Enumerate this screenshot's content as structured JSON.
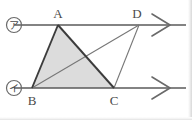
{
  "figure": {
    "background_color": "#ffffff",
    "shaded_fill_color": "#dcdcdc",
    "line_color": "#5a5a5a",
    "dark_line_color": "#3c3c3c",
    "label_color": "#4a4a4a",
    "parallel_lines": [
      {
        "id": "line-upper",
        "marker_label": "ア",
        "marker_name": "circled-a-marker",
        "y": 25,
        "x_start": 14,
        "x_end": 186,
        "arrow_label": ">"
      },
      {
        "id": "line-lower",
        "marker_label": "イ",
        "marker_name": "circled-i-marker",
        "y": 88,
        "x_start": 14,
        "x_end": 186,
        "arrow_label": ">"
      }
    ],
    "points": [
      {
        "id": "A",
        "label": "A",
        "x": 58,
        "y": 25,
        "label_x": 58,
        "label_y": 16,
        "on_line": "line-upper"
      },
      {
        "id": "D",
        "label": "D",
        "x": 139,
        "y": 25,
        "label_x": 137,
        "label_y": 16,
        "on_line": "line-upper"
      },
      {
        "id": "B",
        "label": "B",
        "x": 32,
        "y": 88,
        "label_x": 32,
        "label_y": 104,
        "on_line": "line-lower"
      },
      {
        "id": "C",
        "label": "C",
        "x": 114,
        "y": 88,
        "label_x": 114,
        "label_y": 104,
        "on_line": "line-lower"
      }
    ],
    "segments": [
      {
        "id": "AB",
        "from": "A",
        "to": "B",
        "weight": "heavy"
      },
      {
        "id": "AC",
        "from": "A",
        "to": "C",
        "weight": "heavy"
      },
      {
        "id": "BD",
        "from": "B",
        "to": "D",
        "weight": "light"
      },
      {
        "id": "CD",
        "from": "C",
        "to": "D",
        "weight": "light"
      }
    ],
    "shaded_region": {
      "id": "triangle-ABC",
      "vertices": [
        "A",
        "B",
        "C"
      ],
      "fill": "#dcdcdc"
    }
  }
}
